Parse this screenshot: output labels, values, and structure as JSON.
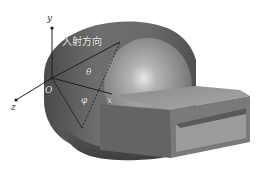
{
  "diagram": {
    "labels": {
      "y_axis": "y",
      "z_axis": "z",
      "x_axis": "x",
      "origin": "O",
      "incident_direction": "入射方向",
      "theta": "θ",
      "phi": "φ"
    },
    "colors": {
      "body_dark": "#555555",
      "body_mid": "#7a7a7a",
      "sphere_light": "#b8b8b8",
      "duct_top": "#9a9a9a",
      "duct_side": "#6a6a6a",
      "duct_inner": "#8c8c8c",
      "axis_line": "#222222",
      "background": "#ffffff"
    }
  }
}
